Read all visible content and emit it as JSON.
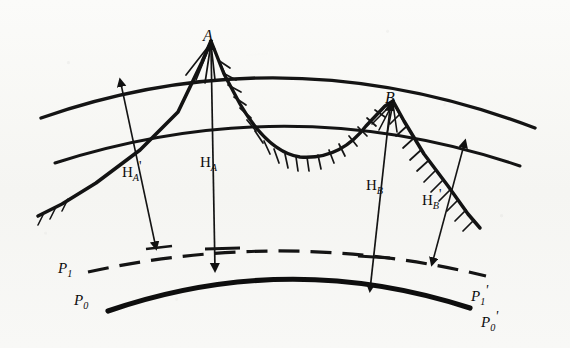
{
  "figure": {
    "kind": "geodetic-height-diagram",
    "background_color": "#f7f7f5",
    "ink_color": "#111111"
  },
  "points": [
    {
      "id": "A",
      "label": "A",
      "x": 211,
      "y": 39
    },
    {
      "id": "B",
      "label": "B",
      "x": 393,
      "y": 101
    }
  ],
  "height_labels": [
    {
      "id": "HA_prime",
      "base": "H",
      "sub": "A",
      "prime": "'",
      "x": 130,
      "y": 168
    },
    {
      "id": "HA",
      "base": "H",
      "sub": "A",
      "prime": "",
      "x": 209,
      "y": 158
    },
    {
      "id": "HB",
      "base": "H",
      "sub": "B",
      "prime": "",
      "x": 373,
      "y": 181
    },
    {
      "id": "HB_prime",
      "base": "H",
      "sub": "B",
      "prime": "'",
      "x": 430,
      "y": 196
    }
  ],
  "surface_labels": [
    {
      "id": "P1",
      "base": "P",
      "sub": "1",
      "prime": "",
      "x": 64,
      "y": 264
    },
    {
      "id": "P0",
      "base": "P",
      "sub": "0",
      "prime": "",
      "x": 80,
      "y": 296
    },
    {
      "id": "P1_prime",
      "base": "P",
      "sub": "1",
      "prime": "'",
      "x": 477,
      "y": 292
    },
    {
      "id": "P0_prime",
      "base": "P",
      "sub": "0",
      "prime": "'",
      "x": 487,
      "y": 318
    }
  ],
  "curves": {
    "outer_arc": {
      "name": "upper-reference-arc",
      "style": "solid-thick"
    },
    "inner_arc": {
      "name": "lower-reference-arc",
      "style": "solid-thick"
    },
    "terrain": {
      "name": "terrain-profile",
      "style": "solid-hatched"
    },
    "p1_arc": {
      "name": "p1-dashed-arc",
      "style": "dashed"
    },
    "p0_arc": {
      "name": "p0-geoid-arc",
      "style": "solid-heavy"
    }
  },
  "measure_lines": [
    {
      "id": "HA_prime_line",
      "from": "outer-arc",
      "to": "p1-arc",
      "arrow": "both"
    },
    {
      "id": "HA_line",
      "from": "summit-A",
      "to": "p0-arc",
      "arrow": "both"
    },
    {
      "id": "HB_line",
      "from": "summit-B",
      "to": "p0-arc",
      "arrow": "both"
    },
    {
      "id": "HB_prime_line",
      "from": "inner-arc",
      "to": "p1-arc",
      "arrow": "both"
    }
  ]
}
